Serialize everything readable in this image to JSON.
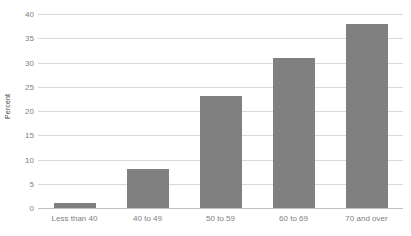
{
  "chart_data": {
    "type": "bar",
    "title": "",
    "subtitle": "",
    "xlabel": "",
    "ylabel": "Percent",
    "categories": [
      "Less than 40",
      "40 to 49",
      "50 to 59",
      "60 to 69",
      "70 and over"
    ],
    "values": [
      1,
      8,
      23,
      31,
      38
    ],
    "ylim": [
      0,
      40
    ],
    "ytick_step": 5,
    "yticks": [
      0,
      5,
      10,
      15,
      20,
      25,
      30,
      35,
      40
    ],
    "ytick_labels": [
      "0",
      "5",
      "10",
      "15",
      "20",
      "25",
      "30",
      "35",
      "40"
    ],
    "grid": true,
    "grid_axis": "y",
    "legend": false,
    "legend_position": "none",
    "series": [
      {
        "name": "Percent",
        "values": [
          1,
          8,
          23,
          31,
          38
        ]
      }
    ]
  },
  "style": {
    "bar_color": "#808080",
    "gridline_color": "#d9d9d9",
    "baseline_color": "#bfbfbf",
    "tick_label_color": "#808080",
    "axis_title_color": "#3b3b3b",
    "background_color": "#ffffff"
  }
}
